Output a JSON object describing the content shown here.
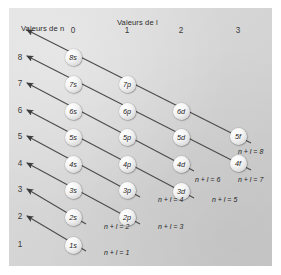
{
  "figure": {
    "title_vertical_axis": "Valeurs de n",
    "title_horizontal_axis": "Valeurs de l",
    "background_color": "#d6d6d6",
    "line_color": "#4a4a4a",
    "orbital_fill": "#f2f2f2"
  },
  "chart_data": {
    "type": "diagram",
    "xlabel": "Valeurs de l",
    "ylabel": "Valeurs de n",
    "column_headers": [
      "0",
      "1",
      "2",
      "3"
    ],
    "row_headers": [
      "8",
      "7",
      "6",
      "5",
      "4",
      "3",
      "2",
      "1"
    ],
    "orbitals": [
      {
        "label": "8s",
        "n": 8,
        "l": 0,
        "x": 73,
        "y": 57
      },
      {
        "label": "7s",
        "n": 7,
        "l": 0,
        "x": 73,
        "y": 84
      },
      {
        "label": "7p",
        "n": 7,
        "l": 1,
        "x": 127,
        "y": 84
      },
      {
        "label": "6s",
        "n": 6,
        "l": 0,
        "x": 73,
        "y": 111
      },
      {
        "label": "6p",
        "n": 6,
        "l": 1,
        "x": 127,
        "y": 111
      },
      {
        "label": "6d",
        "n": 6,
        "l": 2,
        "x": 181,
        "y": 111
      },
      {
        "label": "5s",
        "n": 5,
        "l": 0,
        "x": 73,
        "y": 137
      },
      {
        "label": "5p",
        "n": 5,
        "l": 1,
        "x": 127,
        "y": 137
      },
      {
        "label": "5d",
        "n": 5,
        "l": 2,
        "x": 181,
        "y": 137
      },
      {
        "label": "5f",
        "n": 5,
        "l": 3,
        "x": 238,
        "y": 136
      },
      {
        "label": "4s",
        "n": 4,
        "l": 0,
        "x": 73,
        "y": 164
      },
      {
        "label": "4p",
        "n": 4,
        "l": 1,
        "x": 127,
        "y": 164
      },
      {
        "label": "4d",
        "n": 4,
        "l": 2,
        "x": 181,
        "y": 164
      },
      {
        "label": "4f",
        "n": 4,
        "l": 3,
        "x": 238,
        "y": 163
      },
      {
        "label": "3s",
        "n": 3,
        "l": 0,
        "x": 73,
        "y": 190
      },
      {
        "label": "3p",
        "n": 3,
        "l": 1,
        "x": 127,
        "y": 190
      },
      {
        "label": "3d",
        "n": 3,
        "l": 2,
        "x": 181,
        "y": 191
      },
      {
        "label": "2s",
        "n": 2,
        "l": 0,
        "x": 73,
        "y": 217
      },
      {
        "label": "2p",
        "n": 2,
        "l": 1,
        "x": 127,
        "y": 217
      },
      {
        "label": "1s",
        "n": 1,
        "l": 0,
        "x": 73,
        "y": 245
      }
    ],
    "diagonal_labels": [
      {
        "text": "n + l = 1",
        "x": 104,
        "y": 254
      },
      {
        "text": "n + l = 2",
        "x": 104,
        "y": 228
      },
      {
        "text": "n + l = 3",
        "x": 158,
        "y": 228
      },
      {
        "text": "n + l = 4",
        "x": 158,
        "y": 201
      },
      {
        "text": "n + l = 5",
        "x": 212,
        "y": 201
      },
      {
        "text": "n + l = 6",
        "x": 195,
        "y": 181
      },
      {
        "text": "n + l = 7",
        "x": 238,
        "y": 181
      },
      {
        "text": "n + l = 8",
        "x": 238,
        "y": 153
      }
    ]
  }
}
